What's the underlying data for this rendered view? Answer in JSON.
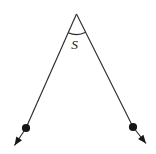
{
  "figure": {
    "angle_label": "S",
    "colors": {
      "stroke": "#2b2b2b",
      "fill": "#161616",
      "background": "#ffffff",
      "label": "#1c1c1c"
    },
    "canvas": {
      "width": 156,
      "height": 154
    },
    "stroke_width": 1.15,
    "vertex": {
      "x": 76.5,
      "y": 14
    },
    "arc_radius": 20.5,
    "label": {
      "x": 74.5,
      "y": 48.5,
      "font_size": 13.5
    },
    "rays": {
      "left": {
        "dot": {
          "x": 26,
          "y": 128,
          "r": 4.1
        },
        "arrow_tip": {
          "x": 14.5,
          "y": 145.5
        }
      },
      "right": {
        "dot": {
          "x": 133,
          "y": 127,
          "r": 4.1
        },
        "arrow_tip": {
          "x": 146,
          "y": 143.5
        }
      }
    },
    "arrowhead": {
      "length": 8.5,
      "half_width": 3.4
    }
  }
}
